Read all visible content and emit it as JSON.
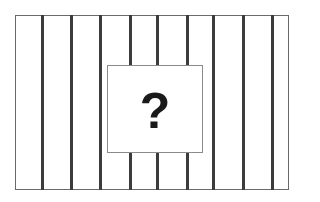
{
  "diagram": {
    "frame": {
      "x": 15,
      "y": 15,
      "width": 274,
      "height": 175,
      "border_color": "#6a6a6a"
    },
    "bars": {
      "color": "#3c3c3c",
      "x_positions": [
        41,
        70,
        99,
        129,
        156,
        186,
        212,
        242,
        271
      ]
    },
    "center_box": {
      "x": 107,
      "y": 65,
      "width": 96,
      "height": 88,
      "border_color": "#8a8a8a",
      "symbol": "?",
      "symbol_color": "#1a1a1a"
    }
  }
}
